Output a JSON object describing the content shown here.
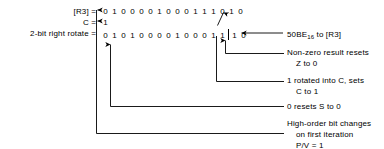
{
  "diagram": {
    "rows": [
      {
        "name": "r3",
        "label": "[R3] =",
        "bits": [
          "0",
          "1",
          "0",
          "0",
          "0",
          "0",
          "1",
          "0",
          "0",
          "0",
          "1",
          "1",
          "1",
          "0",
          "1",
          "0"
        ]
      },
      {
        "name": "carry",
        "label": "C =",
        "bits": [
          "1"
        ]
      },
      {
        "name": "rotate",
        "label": "2-bit right rotate =",
        "bits_left": [
          "0",
          "1",
          "0",
          "1",
          "0",
          "0",
          "0",
          "0",
          "1",
          "0",
          "0",
          "0",
          "1",
          "1"
        ],
        "bits_right": [
          "1",
          "0"
        ]
      }
    ],
    "annotations": [
      {
        "name": "hex-result",
        "line1_pre": "50BE",
        "line1_sub": "16",
        "line1_post": " to [R3]"
      },
      {
        "name": "zero-flag",
        "line1": "Non-zero result resets",
        "line2": "Z to 0"
      },
      {
        "name": "carry-flag",
        "line1": "1 rotated into C, sets",
        "line2": "C to 1"
      },
      {
        "name": "sign-flag",
        "line1": "0 resets S to 0"
      },
      {
        "name": "parity-overflow-flag",
        "line1": "High-order bit changes",
        "line2": "on first iteration",
        "line3": "P/V = 1"
      }
    ],
    "colors": {
      "ink": "#000000",
      "paper": "#ffffff"
    }
  }
}
